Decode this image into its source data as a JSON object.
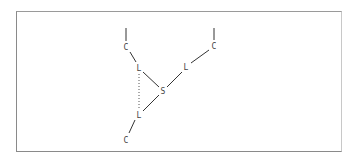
{
  "diagram": {
    "type": "molecular-structure",
    "nodes": [
      {
        "id": "c_top_left",
        "label": "C",
        "x": 126,
        "y": 47
      },
      {
        "id": "l_upper_left",
        "label": "L",
        "x": 139,
        "y": 68
      },
      {
        "id": "s_center",
        "label": "S",
        "x": 163,
        "y": 91
      },
      {
        "id": "l_lower",
        "label": "L",
        "x": 139,
        "y": 115
      },
      {
        "id": "c_bottom",
        "label": "C",
        "x": 126,
        "y": 139
      },
      {
        "id": "l_upper_right",
        "label": "L",
        "x": 186,
        "y": 67
      },
      {
        "id": "c_top_right",
        "label": "C",
        "x": 214,
        "y": 46
      }
    ],
    "edges": [
      {
        "from": "c_top_left",
        "to": "l_upper_left",
        "style": "solid"
      },
      {
        "from": "l_upper_left",
        "to": "s_center",
        "style": "solid"
      },
      {
        "from": "s_center",
        "to": "l_lower",
        "style": "solid"
      },
      {
        "from": "l_lower",
        "to": "c_bottom",
        "style": "solid"
      },
      {
        "from": "s_center",
        "to": "l_upper_right",
        "style": "solid"
      },
      {
        "from": "l_upper_right",
        "to": "c_top_right",
        "style": "solid"
      },
      {
        "from": "l_upper_left",
        "to": "l_lower",
        "style": "dotted"
      }
    ],
    "stubs": [
      {
        "attached_to": "c_top_left",
        "direction": "up"
      },
      {
        "attached_to": "c_top_right",
        "direction": "up"
      }
    ]
  }
}
